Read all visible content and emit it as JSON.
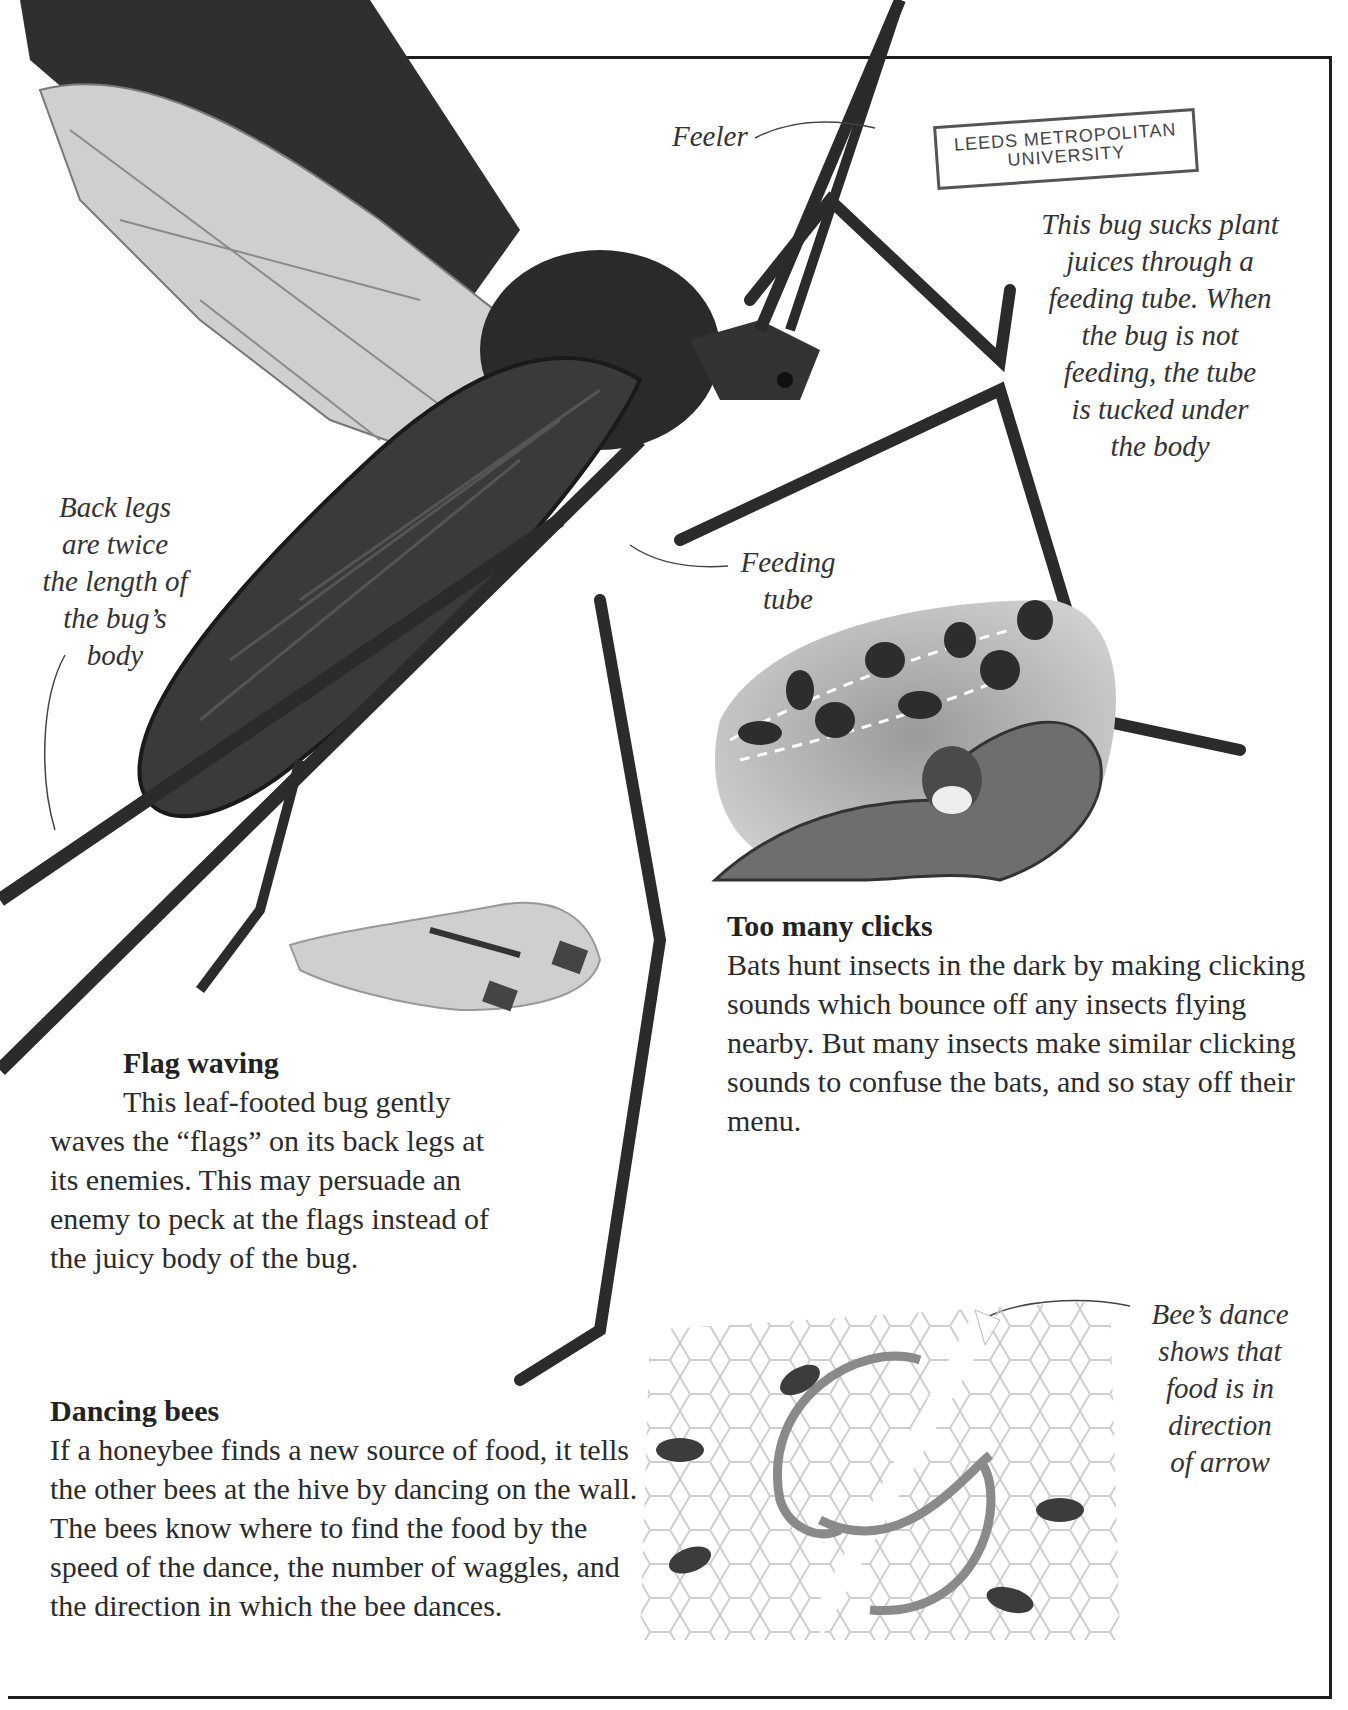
{
  "page": {
    "type": "scanned book page",
    "palette": {
      "ink": "#2a2a2a",
      "frame": "#1e1e1e",
      "paper": "#ffffff"
    }
  },
  "stamp": {
    "line1": "LEEDS METROPOLITAN",
    "line2": "UNIVERSITY"
  },
  "main_illustration": {
    "subject": "leaf-footed bug (large photograph, black and white)"
  },
  "captions": {
    "feeler": "Feeler",
    "juices": "This bug sucks plant\njuices through a\nfeeding tube. When\nthe bug is not\nfeeding, the tube\nis tucked under\nthe body",
    "back_legs": "Back legs\nare twice\nthe length of\nthe bug’s\nbody",
    "feeding_tube": "Feeding\ntube",
    "bee_dance": "Bee’s dance\nshows that\nfood is in\ndirection\nof arrow"
  },
  "sections": {
    "clicks": {
      "heading": "Too many clicks",
      "body": "Bats hunt insects in the dark by making clicking sounds which bounce off any insects flying nearby. But many insects make similar clicking sounds to confuse the bats, and so stay off their menu.",
      "illustration": "bat chasing spotted moths"
    },
    "flag": {
      "heading": "Flag waving",
      "body": "This leaf-footed bug gently waves the “flags” on its back legs at its enemies. This may persuade an enemy to peck at the flags instead of the juicy body of the bug.",
      "illustration": "leaf-footed bug on a hand"
    },
    "bees": {
      "heading": "Dancing bees",
      "body": "If a honeybee finds a new source of food, it tells the other bees at the hive by dancing on the wall. The bees know where to find the food by the speed of the dance, the number of waggles, and the direction in which the bee dances.",
      "illustration": "bees on honeycomb with figure-eight dance arrows"
    }
  }
}
